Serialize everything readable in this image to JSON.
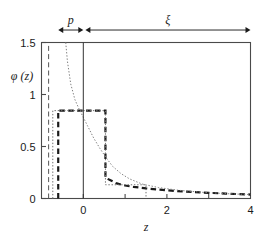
{
  "chart_data": {
    "type": "line",
    "title": "",
    "xlabel": "z",
    "ylabel": "φ (z)",
    "xlim": [
      -1.0,
      4.0
    ],
    "ylim": [
      0.0,
      1.5
    ],
    "grid": false,
    "legend": "none",
    "xticks": [
      -1,
      0,
      1,
      2,
      3,
      4
    ],
    "xticklabels": [
      "",
      "0",
      "",
      "2",
      "",
      "4"
    ],
    "yticks": [
      0,
      0.5,
      1,
      1.5
    ],
    "yticklabels": [
      "0",
      "0.5",
      "1",
      "1.5"
    ],
    "annotations": [
      {
        "name": "p",
        "label": "p",
        "type": "double-arrow",
        "x_start": -0.6,
        "x_end": 0.0,
        "y": 1.62
      },
      {
        "name": "xi",
        "label": "ξ",
        "type": "double-arrow",
        "x_start": 0.05,
        "x_end": 4.0,
        "y": 1.62
      }
    ],
    "series": [
      {
        "name": "step-profile-dashed",
        "style": "dashed",
        "linewidth": 2.2,
        "color": "#1a1a1a",
        "x": [
          -0.6,
          -0.6,
          0.53,
          0.53,
          0.65,
          0.8,
          1.0,
          1.2,
          1.5,
          1.8,
          2.2,
          2.6,
          3.0,
          3.4,
          4.0
        ],
        "y": [
          0.0,
          0.845,
          0.845,
          0.2,
          0.175,
          0.145,
          0.125,
          0.112,
          0.097,
          0.086,
          0.073,
          0.063,
          0.055,
          0.047,
          0.038
        ]
      },
      {
        "name": "box-profile-dotted",
        "style": "dotted",
        "linewidth": 1.0,
        "color": "#707070",
        "x": [
          -0.73,
          -0.73,
          0.53,
          0.53,
          1.5,
          1.5
        ],
        "y": [
          0.0,
          0.845,
          0.845,
          0.132,
          0.132,
          0.0
        ]
      },
      {
        "name": "decay-curve-dotted",
        "style": "dotted",
        "linewidth": 1.0,
        "color": "#808080",
        "x": [
          -0.42,
          -0.38,
          -0.3,
          -0.2,
          -0.1,
          0.0,
          0.1,
          0.25,
          0.4,
          0.55,
          0.7,
          0.9,
          1.1,
          1.4,
          1.8,
          2.3,
          2.9,
          3.5,
          4.0
        ],
        "y": [
          1.5,
          1.32,
          1.1,
          0.95,
          0.86,
          0.78,
          0.7,
          0.58,
          0.48,
          0.39,
          0.31,
          0.24,
          0.19,
          0.14,
          0.105,
          0.078,
          0.058,
          0.045,
          0.038
        ]
      },
      {
        "name": "left-boundary-dashed",
        "style": "dashed",
        "linewidth": 1.0,
        "color": "#555555",
        "x": [
          -0.83,
          -0.83
        ],
        "y": [
          0.0,
          1.5
        ]
      },
      {
        "name": "origin-line-solid",
        "style": "solid",
        "linewidth": 1.0,
        "color": "#333333",
        "x": [
          0.0,
          0.0
        ],
        "y": [
          0.0,
          1.5
        ]
      }
    ]
  }
}
